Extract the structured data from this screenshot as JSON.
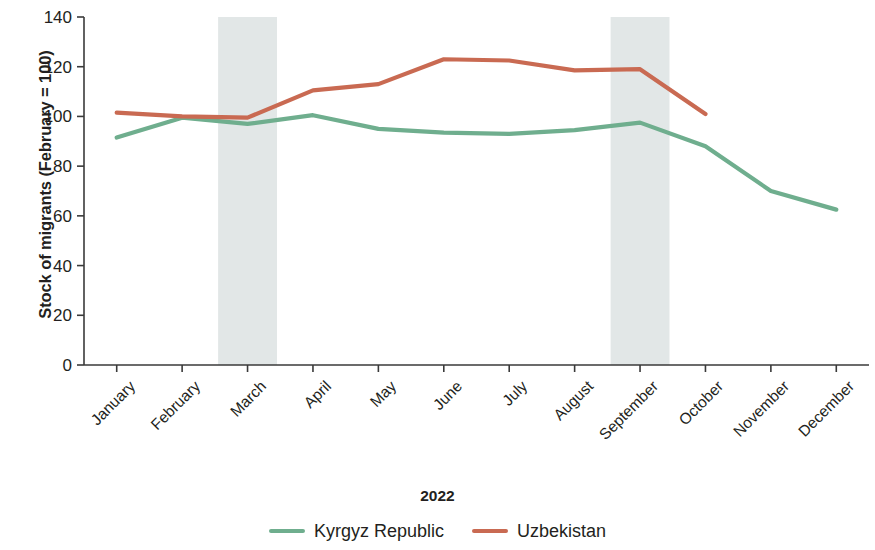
{
  "chart_data": {
    "type": "line",
    "title": "",
    "xlabel": "2022",
    "ylabel": "Stock of migrants (February = 100)",
    "categories": [
      "January",
      "February",
      "March",
      "April",
      "May",
      "June",
      "July",
      "August",
      "September",
      "October",
      "November",
      "December"
    ],
    "ylim": [
      0,
      140
    ],
    "yticks": [
      0,
      20,
      40,
      60,
      80,
      100,
      120,
      140
    ],
    "ytick_labels": [
      "0",
      "20",
      "40",
      "60",
      "80",
      "100",
      "120",
      "140"
    ],
    "grid": false,
    "legend_position": "bottom",
    "series": [
      {
        "name": "Kyrgyz Republic",
        "color": "#6FAE8E",
        "values": [
          91.5,
          99.5,
          97.0,
          100.5,
          95.0,
          93.5,
          93.0,
          94.5,
          97.5,
          88.0,
          70.0,
          62.5
        ]
      },
      {
        "name": "Uzbekistan",
        "color": "#C96A52",
        "values": [
          101.5,
          100.0,
          99.5,
          110.5,
          113.0,
          123.0,
          122.5,
          118.5,
          119.0,
          101.0,
          null,
          null
        ]
      }
    ],
    "shaded_bands": [
      {
        "label": "March",
        "start_category": "March",
        "color": "#E2E7E7"
      },
      {
        "label": "September",
        "start_category": "September",
        "color": "#E2E7E7"
      }
    ]
  }
}
